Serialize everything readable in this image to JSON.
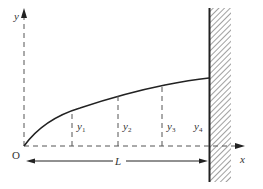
{
  "diagram": {
    "type": "cantilever-deflection",
    "axes": {
      "x_label": "x",
      "y_label": "y",
      "origin_label": "O"
    },
    "dimension": {
      "label": "L"
    },
    "ordinates": [
      {
        "label": "y",
        "sub": "1"
      },
      {
        "label": "y",
        "sub": "2"
      },
      {
        "label": "y",
        "sub": "3"
      },
      {
        "label": "y",
        "sub": "4"
      }
    ],
    "wall": {
      "style": "hatched",
      "side": "right"
    },
    "colors": {
      "line": "#222222",
      "dash": "#555555",
      "text": "#333333",
      "background": "#ffffff"
    }
  }
}
